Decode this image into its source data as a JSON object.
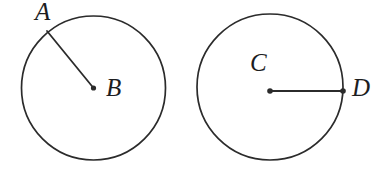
{
  "figure": {
    "background_color": "#ffffff",
    "stroke_color": "#2b2b2b",
    "labels": {
      "a": "A",
      "b": "B",
      "c": "C",
      "d": "D"
    },
    "circles": [
      {
        "name": "left-circle",
        "center_label": "B",
        "endpoint_label": "A",
        "cx": 93.5,
        "cy": 88,
        "r": 72,
        "radius_line": {
          "x1": 93.5,
          "y1": 88,
          "x2": 47,
          "y2": 31
        }
      },
      {
        "name": "right-circle",
        "center_label": "C",
        "endpoint_label": "D",
        "cx": 270,
        "cy": 87,
        "r": 73,
        "radius_line": {
          "x1": 270,
          "y1": 91,
          "x2": 343,
          "y2": 91
        }
      }
    ]
  }
}
